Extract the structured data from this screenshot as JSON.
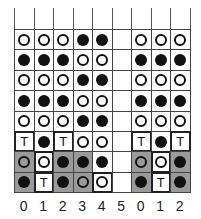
{
  "column_labels": [
    "0",
    "1",
    "2",
    "3",
    "4",
    "5",
    "0",
    "1",
    "2"
  ],
  "legend": {
    "filled": "black dot",
    "open": "white dot",
    "T": "T marker",
    "shaded": "gray cell"
  },
  "rows": [
    [
      "open",
      "open",
      "open",
      "filled",
      "filled",
      "",
      "open",
      "open",
      "open"
    ],
    [
      "filled",
      "filled",
      "filled",
      "open",
      "open",
      "",
      "filled",
      "filled",
      "filled"
    ],
    [
      "open",
      "open",
      "open",
      "filled",
      "filled",
      "",
      "open",
      "open",
      "open"
    ],
    [
      "filled",
      "filled",
      "filled",
      "open",
      "open",
      "",
      "filled",
      "filled",
      "filled"
    ],
    [
      "open",
      "open",
      "open",
      "filled",
      "filled",
      "",
      "open",
      "open",
      "open"
    ],
    [
      "T",
      "filled",
      "T",
      "open",
      "open",
      "",
      "T",
      "filled",
      "T"
    ],
    [
      "open",
      "open",
      "filled",
      "filled",
      "filled",
      "",
      "open",
      "open",
      "filled"
    ],
    [
      "filled",
      "T",
      "filled",
      "open",
      "open",
      "",
      "filled",
      "T",
      "filled"
    ]
  ],
  "shaded": [
    [
      6,
      0
    ],
    [
      6,
      2
    ],
    [
      6,
      3
    ],
    [
      6,
      6
    ],
    [
      6,
      8
    ],
    [
      7,
      0
    ],
    [
      7,
      2
    ],
    [
      7,
      3
    ],
    [
      7,
      6
    ],
    [
      7,
      8
    ]
  ],
  "thick_cells": [
    [
      5,
      0
    ],
    [
      5,
      2
    ],
    [
      5,
      6
    ],
    [
      5,
      8
    ],
    [
      6,
      1
    ],
    [
      6,
      7
    ],
    [
      7,
      1
    ],
    [
      7,
      4
    ],
    [
      7,
      7
    ]
  ]
}
